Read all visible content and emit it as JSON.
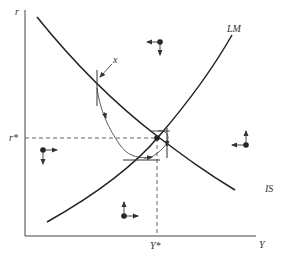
{
  "diagram": {
    "axes": {
      "y_label": "r",
      "x_label": "Y",
      "equilibrium_r_label": "r*",
      "equilibrium_y_label": "Y*"
    },
    "curves": {
      "is_label": "IS",
      "lm_label": "LM"
    },
    "path": {
      "start_label": "x"
    },
    "colors": {
      "line": "#333333",
      "dashed": "#555555",
      "background": "#ffffff"
    },
    "direction_markers": [
      {
        "region": "above-IS-above-LM",
        "horizontal": "left",
        "vertical": "down"
      },
      {
        "region": "above-LM-below-IS",
        "horizontal": "right",
        "vertical": "down"
      },
      {
        "region": "below-IS-below-LM",
        "horizontal": "right",
        "vertical": "up"
      },
      {
        "region": "above-IS-below-LM",
        "horizontal": "left",
        "vertical": "up"
      }
    ]
  }
}
